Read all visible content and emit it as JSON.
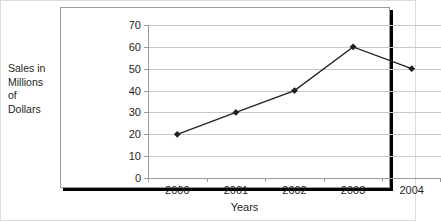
{
  "chart_data": {
    "type": "line",
    "title": "",
    "subtitle": "",
    "xlabel": "Years",
    "ylabel": "Sales in\nMillions\nof\nDollars",
    "ylabel_lines": [
      "Sales in",
      "Millions",
      "of",
      "Dollars"
    ],
    "categories": [
      "2000",
      "2001",
      "2002",
      "2003",
      "2004"
    ],
    "values": [
      20,
      30,
      40,
      60,
      50
    ],
    "series": [
      {
        "name": "Sales",
        "values": [
          20,
          30,
          40,
          60,
          50
        ]
      }
    ],
    "points": [
      {
        "x": "2000",
        "y": 20
      },
      {
        "x": "2001",
        "y": 30
      },
      {
        "x": "2002",
        "y": 40
      },
      {
        "x": "2003",
        "y": 60
      },
      {
        "x": "2004",
        "y": 50
      }
    ],
    "ylim": [
      0,
      70
    ],
    "ytick_step": 10,
    "yticks": [
      0,
      10,
      20,
      30,
      40,
      50,
      60,
      70
    ],
    "ytick_labels": [
      "0",
      "10",
      "20",
      "30",
      "40",
      "50",
      "60",
      "70"
    ],
    "xtick_labels": [
      "2000",
      "2001",
      "2002",
      "2003",
      "2004"
    ],
    "grid": true,
    "grid_axis": "y",
    "legend": false,
    "legend_position": "none",
    "marker": "diamond",
    "annotations": []
  },
  "style": {
    "line_color": "#231f20",
    "marker_color": "#231f20",
    "gridline_color": "#c9c9c9",
    "axis_color": "#9b9b9b",
    "plot_background": "#ffffff",
    "figure_background": "#ffffff",
    "text_color": "#231f20",
    "frame_color": "#dcdcdc",
    "shadow_color": "#000000"
  }
}
